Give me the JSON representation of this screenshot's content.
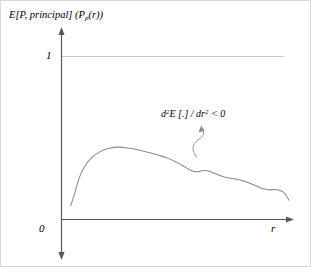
{
  "figure": {
    "width": 311,
    "height": 267,
    "background_color": "#ffffff",
    "border_color": "#d8d8d8"
  },
  "labels": {
    "y_axis_main": "E[P, principal]",
    "y_axis_function_open": "(P",
    "y_axis_function_sub": "p",
    "y_axis_function_close": "(r))",
    "y_tick_one": "1",
    "origin_zero": "0",
    "x_axis": "r",
    "annotation_d": "d",
    "annotation_sup2_a": "2",
    "annotation_E": "E [.] / d",
    "annotation_r": "r",
    "annotation_sup2_b": "2",
    "annotation_ineq": " < 0",
    "annotation_full": "d2E [.] / dr2 < 0"
  },
  "colors": {
    "axis": "#595959",
    "gridline": "#c9c9c9",
    "curve": "#8a8a8a",
    "leader": "#9a9a9a",
    "text": "#000000"
  },
  "chart_data": {
    "type": "line",
    "title": "",
    "subtitle": "",
    "xlabel": "r",
    "ylabel": "E[P, principal] (P_p(r))",
    "xlim": [
      0,
      1
    ],
    "ylim": [
      0,
      1.12
    ],
    "grid": true,
    "gridlines_y": [
      1
    ],
    "legend": false,
    "legend_position": "none",
    "ytick_labels": [
      "0",
      "1"
    ],
    "ytick_values": [
      0,
      1
    ],
    "xtick_labels": [],
    "annotations": [
      {
        "text": "d2E [.] / dr2 < 0",
        "meaning": "second derivative of E with respect to r is negative (concave)",
        "x": 0.6,
        "y": 0.47,
        "points_to": {
          "x": 0.575,
          "y": 0.295
        }
      }
    ],
    "series": [
      {
        "name": "E[P, principal] (P_p(r))",
        "color": "#8a8a8a",
        "x": [
          0.043,
          0.06,
          0.08,
          0.105,
          0.135,
          0.17,
          0.21,
          0.258,
          0.3,
          0.345,
          0.39,
          0.43,
          0.47,
          0.505,
          0.535,
          0.56,
          0.58,
          0.6,
          0.625,
          0.65,
          0.675,
          0.7,
          0.725,
          0.75,
          0.775,
          0.8,
          0.825,
          0.85,
          0.88,
          0.91,
          0.94,
          0.975,
          1.0
        ],
        "y": [
          0.085,
          0.16,
          0.255,
          0.33,
          0.38,
          0.415,
          0.437,
          0.444,
          0.437,
          0.425,
          0.41,
          0.394,
          0.375,
          0.352,
          0.33,
          0.308,
          0.296,
          0.293,
          0.3,
          0.296,
          0.282,
          0.268,
          0.258,
          0.252,
          0.245,
          0.236,
          0.224,
          0.21,
          0.192,
          0.182,
          0.184,
          0.168,
          0.118
        ]
      }
    ]
  }
}
